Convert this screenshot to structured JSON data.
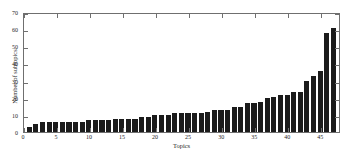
{
  "chart_data": {
    "type": "bar",
    "title": "",
    "xlabel": "Topics",
    "ylabel": "Number of subtopics",
    "xlim": [
      0,
      48
    ],
    "ylim": [
      0,
      70
    ],
    "grid": false,
    "legend": null,
    "bar_color": "#1b1b1b",
    "axis_color": "#6f6f6f",
    "background": "#ffffff",
    "xticks": [
      0,
      5,
      10,
      15,
      20,
      25,
      30,
      35,
      40,
      45
    ],
    "yticks": [
      0,
      10,
      20,
      30,
      40,
      50,
      60,
      70
    ],
    "categories": [
      1,
      2,
      3,
      4,
      5,
      6,
      7,
      8,
      9,
      10,
      11,
      12,
      13,
      14,
      15,
      16,
      17,
      18,
      19,
      20,
      21,
      22,
      23,
      24,
      25,
      26,
      27,
      28,
      29,
      30,
      31,
      32,
      33,
      34,
      35,
      36,
      37,
      38,
      39,
      40,
      41,
      42,
      43,
      44,
      45,
      46,
      47
    ],
    "values": [
      3,
      5,
      6,
      6,
      6,
      6,
      6,
      6,
      6,
      7,
      7,
      7,
      7,
      8,
      8,
      8,
      8,
      9,
      9,
      10,
      10,
      10,
      11,
      11,
      11,
      11,
      11,
      12,
      13,
      13,
      13,
      15,
      15,
      17,
      17,
      18,
      20,
      21,
      22,
      22,
      24,
      24,
      30,
      33,
      36,
      59,
      62
    ]
  }
}
